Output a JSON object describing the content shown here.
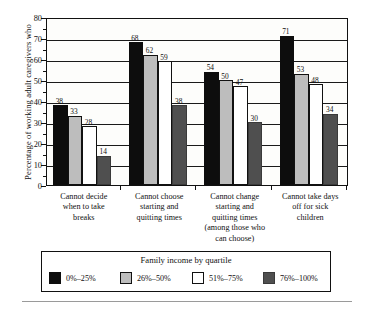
{
  "chart_data": {
    "type": "bar",
    "title": "",
    "xlabel": "",
    "ylabel": "Percentage of working adult caregivers who",
    "ylim": [
      0,
      80
    ],
    "ytick_step": 10,
    "yticks": [
      0,
      10,
      20,
      30,
      40,
      50,
      60,
      70,
      80
    ],
    "grid": true,
    "legend_position": "bottom",
    "legend_title": "Family income by quartile",
    "categories": [
      "Cannot decide when to take breaks",
      "Cannot choose starting and quitting times",
      "Cannot change starting and quitting times (among those who can choose)",
      "Cannot take days off for sick children"
    ],
    "category_lines": [
      [
        "Cannot decide",
        "when to take",
        "breaks"
      ],
      [
        "Cannot choose",
        "starting and",
        "quitting times"
      ],
      [
        "Cannot change",
        "starting and",
        "quitting times",
        "(among those who",
        "can choose)"
      ],
      [
        "Cannot take days",
        "off for sick",
        "children"
      ]
    ],
    "series": [
      {
        "name": "0%–25%",
        "color": "#0d0d0d",
        "values": [
          38,
          68,
          54,
          71
        ]
      },
      {
        "name": "26%–50%",
        "color": "#bdbdbd",
        "values": [
          33,
          62,
          50,
          53
        ]
      },
      {
        "name": "51%–75%",
        "color": "#ffffff",
        "values": [
          28,
          59,
          47,
          48
        ]
      },
      {
        "name": "76%–100%",
        "color": "#4f4f4f",
        "values": [
          14,
          38,
          30,
          34
        ]
      }
    ]
  }
}
